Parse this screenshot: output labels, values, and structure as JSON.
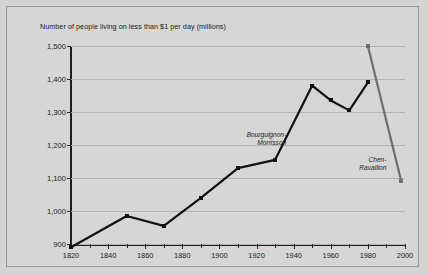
{
  "chart_data": {
    "type": "line",
    "title": "Number of people living on less than $1 per day (millions)",
    "xlabel": "",
    "ylabel": "",
    "xlim": [
      1820,
      2000
    ],
    "ylim": [
      900,
      1500
    ],
    "yticks": [
      "1,500",
      "1,400",
      "1,300",
      "1,200",
      "1,100",
      "1,000",
      "900"
    ],
    "ytick_values": [
      1500,
      1400,
      1300,
      1200,
      1100,
      1000,
      900
    ],
    "xticks": [
      "1820",
      "1840",
      "1860",
      "1880",
      "1900",
      "1920",
      "1940",
      "1960",
      "1980",
      "2000"
    ],
    "xtick_values": [
      1820,
      1840,
      1860,
      1880,
      1900,
      1920,
      1940,
      1960,
      1980,
      2000
    ],
    "xtick_minor_step": 10,
    "grid": "horizontal",
    "legend": "annotations",
    "series": [
      {
        "name": "Bourguignon-Morrisson",
        "color": "#111111",
        "x": [
          1820,
          1850,
          1870,
          1890,
          1910,
          1930,
          1950,
          1960,
          1970,
          1980
        ],
        "values": [
          890,
          985,
          955,
          1040,
          1130,
          1155,
          1380,
          1335,
          1305,
          1390
        ]
      },
      {
        "name": "Chen-Ravallion",
        "color": "#6d6d6d",
        "x": [
          1980,
          1998
        ],
        "values": [
          1500,
          1090
        ]
      }
    ],
    "annotations": [
      {
        "text_line1": "Bourguignon-",
        "text_line2": "Morrisson",
        "x": 1936,
        "y": 1218
      },
      {
        "text_line1": "Chen-",
        "text_line2": "Ravallion",
        "x": 1990,
        "y": 1142
      }
    ]
  }
}
